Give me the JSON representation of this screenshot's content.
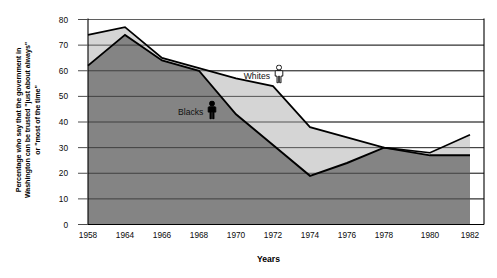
{
  "chart_data": {
    "type": "area",
    "title": "",
    "subtitle": "",
    "xlabel": "Years",
    "ylabel": "Percentage who say that the government in Washington can be trusted \"just about always\" or \"most of the time\"",
    "ylabel_lines": [
      "Percentage who say that the government in",
      "Washington can be trusted \"just about always\"",
      "or \"most of the time\""
    ],
    "categories": [
      "1958",
      "1964",
      "1966",
      "1968",
      "1970",
      "1972",
      "1974",
      "1976",
      "1978",
      "1980",
      "1982"
    ],
    "x": [
      1958,
      1964,
      1966,
      1968,
      1970,
      1972,
      1974,
      1976,
      1978,
      1980,
      1982
    ],
    "series": [
      {
        "name": "Whites",
        "color": "#d5d5d5",
        "line_color": "#000000",
        "icon": "person-outline-icon",
        "values": [
          74,
          77,
          65,
          61,
          57,
          54,
          38,
          34,
          30,
          28,
          35
        ]
      },
      {
        "name": "Blacks",
        "color": "#848484",
        "line_color": "#000000",
        "icon": "person-filled-icon",
        "values": [
          62,
          74,
          64,
          60,
          43,
          31,
          19,
          24,
          30,
          27,
          27
        ]
      }
    ],
    "ylim": [
      0,
      80
    ],
    "yticks": [
      0,
      10,
      20,
      30,
      40,
      50,
      60,
      70,
      80
    ],
    "ytick_labels": [
      "0",
      "10",
      "20",
      "30",
      "40",
      "50",
      "60",
      "70",
      "80"
    ],
    "grid": true,
    "grid_axis": "y",
    "legend_position": "inside-plot",
    "annotations": [
      {
        "text": "Whites",
        "x": 1972,
        "y": 58,
        "icon": "person-outline-icon"
      },
      {
        "text": "Blacks",
        "x": 1968.4,
        "y": 44,
        "icon": "person-filled-icon"
      }
    ]
  },
  "colors": {
    "whites_fill": "#d5d5d5",
    "blacks_fill": "#848484",
    "axis": "#000000",
    "grid": "#4d4d4d",
    "background": "#ffffff",
    "text": "#0a0a0a"
  }
}
